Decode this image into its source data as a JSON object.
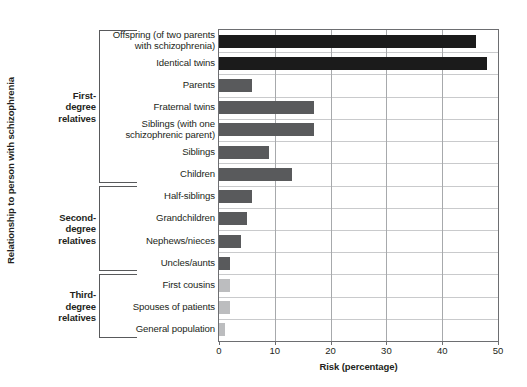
{
  "chart_data": {
    "type": "bar",
    "orientation": "horizontal",
    "title": "",
    "xlabel": "Risk (percentage)",
    "ylabel": "Relationship to person with schizophrenia",
    "xlim": [
      0,
      50
    ],
    "xticks": [
      0,
      10,
      20,
      30,
      40,
      50
    ],
    "xtick_labels": [
      "0",
      "10",
      "20",
      "30",
      "40",
      "50"
    ],
    "grid": "vertical-and-horizontal",
    "legend": "none",
    "categories": [
      "Offspring (of two parents with schizophrenia)",
      "Identical twins",
      "Parents",
      "Fraternal twins",
      "Siblings (with one schizophrenic parent)",
      "Siblings",
      "Children",
      "Half-siblings",
      "Grandchildren",
      "Nephews/nieces",
      "Uncles/aunts",
      "First cousins",
      "Spouses  of patients",
      "General population"
    ],
    "category_lines": [
      [
        "Offspring (of two parents",
        "with schizophrenia)"
      ],
      [
        "Identical twins"
      ],
      [
        "Parents"
      ],
      [
        "Fraternal twins"
      ],
      [
        "Siblings (with one",
        "schizophrenic parent)"
      ],
      [
        "Siblings"
      ],
      [
        "Children"
      ],
      [
        "Half-siblings"
      ],
      [
        "Grandchildren"
      ],
      [
        "Nephews/nieces"
      ],
      [
        "Uncles/aunts"
      ],
      [
        "First cousins"
      ],
      [
        "Spouses  of patients"
      ],
      [
        "General population"
      ]
    ],
    "values": [
      46,
      48,
      6,
      17,
      17,
      9,
      13,
      6,
      5,
      4,
      2,
      2,
      2,
      1
    ],
    "bar_colors": [
      "#1b1b1b",
      "#1b1b1b",
      "#595a5c",
      "#595a5c",
      "#595a5c",
      "#595a5c",
      "#595a5c",
      "#595a5c",
      "#595a5c",
      "#595a5c",
      "#595a5c",
      "#bcbdbf",
      "#bcbdbf",
      "#bcbdbf"
    ],
    "groups": [
      {
        "label_lines": [
          "First-",
          "degree",
          "relatives"
        ],
        "first_index": 0,
        "last_index": 6
      },
      {
        "label_lines": [
          "Second-",
          "degree",
          "relatives"
        ],
        "first_index": 7,
        "last_index": 10
      },
      {
        "label_lines": [
          "Third-",
          "degree",
          "relatives"
        ],
        "first_index": 11,
        "last_index": 13
      }
    ]
  },
  "colors": {
    "dark_bar": "#1b1b1b",
    "mid_bar": "#595a5c",
    "light_bar": "#bcbdbf",
    "axis": "#6d6e71",
    "gridline_h": "#c9cacc",
    "gridline_v": "#a7a9ac",
    "text": "#231f20",
    "background": "#ffffff"
  }
}
